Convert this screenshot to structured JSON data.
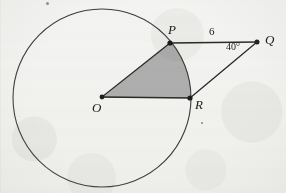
{
  "figure": {
    "kind": "geometry-diagram",
    "background_color": "#f3f3f1",
    "ink_color": "#1c1c1c",
    "shade_color": "#a9a9a9"
  },
  "points": {
    "O": {
      "label": "O",
      "x": 102,
      "y": 97,
      "role": "circle-center"
    },
    "P": {
      "label": "P",
      "x": 170,
      "y": 43,
      "role": "on-circle"
    },
    "Q": {
      "label": "Q",
      "x": 257,
      "y": 42,
      "role": "external-point"
    },
    "R": {
      "label": "R",
      "x": 190,
      "y": 98,
      "role": "on-circle"
    }
  },
  "circle": {
    "center_x": 102,
    "center_y": 98,
    "radius": 89
  },
  "segments": [
    {
      "name": "OP",
      "from": "O",
      "to": "P"
    },
    {
      "name": "OR",
      "from": "O",
      "to": "R"
    },
    {
      "name": "PQ",
      "from": "P",
      "to": "Q"
    },
    {
      "name": "RQ",
      "from": "R",
      "to": "Q"
    }
  ],
  "measurements": {
    "side_PQ": "6",
    "angle_Q": "40°"
  },
  "shaded_region": {
    "name": "sector-POR",
    "vertices": [
      "O",
      "P",
      "R"
    ],
    "fill": "#a9a9a9"
  }
}
